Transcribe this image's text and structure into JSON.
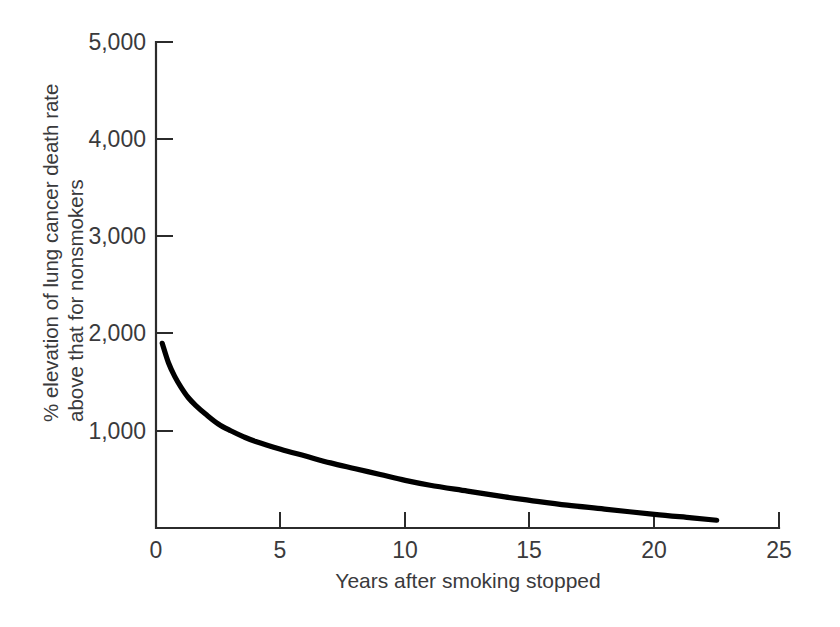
{
  "chart_data": {
    "type": "line",
    "title": "",
    "subtitle": "",
    "xlabel": "Years after smoking stopped",
    "ylabel_line1": "% elevation of lung cancer death rate",
    "ylabel_line2": "above that for nonsmokers",
    "xlim": [
      0,
      25
    ],
    "ylim": [
      0,
      5000
    ],
    "grid": false,
    "legend": "none",
    "xticks": [
      0,
      5,
      10,
      15,
      20,
      25
    ],
    "xtick_labels": [
      "0",
      "5",
      "10",
      "15",
      "20",
      "25"
    ],
    "yticks": [
      1000,
      2000,
      3000,
      4000,
      5000
    ],
    "ytick_labels": [
      "1,000",
      "2,000",
      "3,000",
      "4,000",
      "5,000"
    ],
    "series": [
      {
        "name": "Excess lung cancer death rate of ex-smokers",
        "color": "#000000",
        "x": [
          0.25,
          0.5,
          0.75,
          1.0,
          1.3,
          1.6,
          2.0,
          2.5,
          3.0,
          3.5,
          4.0,
          5.0,
          6.0,
          7.0,
          8.0,
          9.0,
          10.0,
          11.0,
          12.5,
          14.0,
          15.0,
          16.5,
          18.0,
          20.0,
          21.5,
          22.5
        ],
        "y": [
          1900,
          1700,
          1560,
          1450,
          1340,
          1260,
          1170,
          1070,
          1000,
          940,
          890,
          810,
          740,
          670,
          610,
          550,
          490,
          440,
          380,
          320,
          285,
          235,
          195,
          140,
          105,
          80
        ]
      }
    ],
    "axis_color": "#2b2b2b",
    "text_color": "#3a3a3c",
    "background_color": "#ffffff"
  },
  "geometry": {
    "plot_left_px": 156,
    "plot_bottom_px": 528,
    "plot_right_px": 779,
    "plot_top_px": 42
  }
}
